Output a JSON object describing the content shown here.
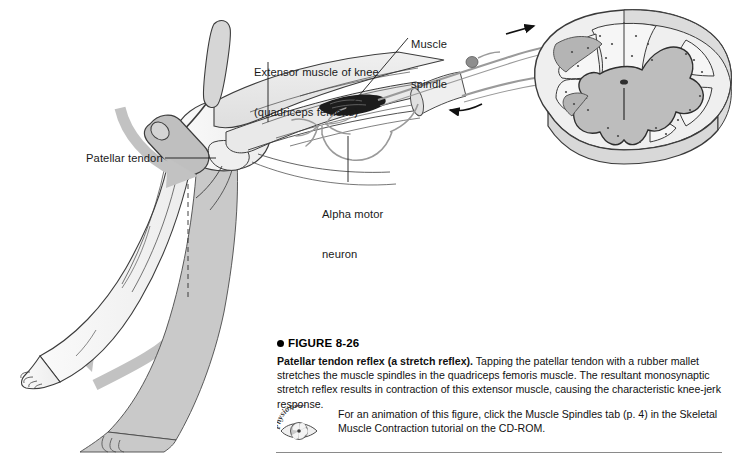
{
  "figure": {
    "number_label": "FIGURE 8-26",
    "bullet_icon": "filled-circle",
    "title": "Patellar tendon reflex (a stretch reflex).",
    "caption_body": "  Tapping the patellar tendon with a rubber mallet stretches the muscle spindles in the quadriceps femoris muscle. The resultant monosynaptic stretch reflex results in contraction of this extensor muscle, causing the characteristic knee-jerk response.",
    "cdrom_note": "For an animation of this figure, click the Muscle Spindles tab (p. 4) in the Skeletal Muscle Contraction tutorial on the CD-ROM.",
    "logo_text": "PhysioEdge"
  },
  "labels": {
    "extensor_muscle_line1": "Extensor muscle of knee",
    "extensor_muscle_line2": "(quadriceps femoris)",
    "muscle_spindle_line1": "Muscle",
    "muscle_spindle_line2": "spindle",
    "patellar_tendon": "Patellar tendon",
    "alpha_motor_line1": "Alpha motor",
    "alpha_motor_line2": "neuron"
  },
  "colors": {
    "ink": "#1a1a1a",
    "outline": "#3c3c3c",
    "limb_fill": "#f2f2f2",
    "muscle_fill": "#e4e4e4",
    "shadow_limb": "#c8c8c8",
    "gray_matter": "#bdbdbd",
    "white_matter": "#f4f4f4",
    "nerve": "#9a9a9a",
    "motion_arrow": "#c2c2c2",
    "spindle_dark": "#1c1c1c",
    "rule": "#8a8a8a",
    "background": "#ffffff"
  },
  "graphic_parts": {
    "reflex_hammer": "rubber mallet striking patellar tendon",
    "tap_arrow": "downward curved motion arrow at tendon",
    "kick_arrow": "upward curved motion arrow at foot",
    "spinal_cord": "spinal cord cross section with butterfly gray matter",
    "dorsal_root_ganglion": "dark oval on afferent fiber",
    "afferent_arrow": "arrow toward spinal cord",
    "efferent_arrow": "arrow away from spinal cord",
    "dashed_reference_line": "vertical dashed line at resting leg position"
  }
}
